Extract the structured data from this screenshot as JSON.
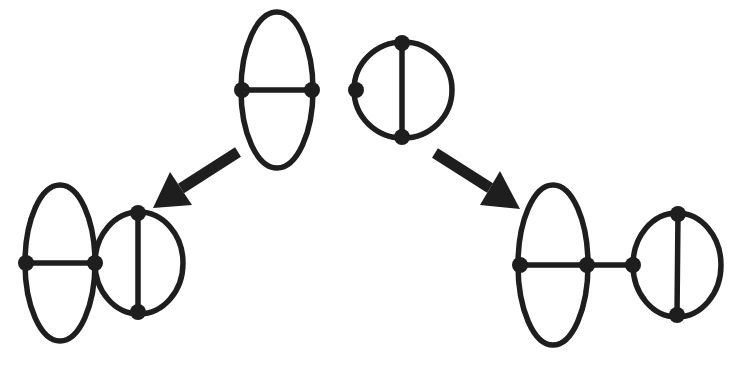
{
  "diagram": {
    "type": "feynman-graph-sewing",
    "colors": {
      "stroke": "#1e1e1e",
      "background": "#ffffff"
    },
    "graphs": [
      {
        "id": "top-theta",
        "label": "Ellipse with horizontal chord (theta graph)",
        "ellipse": {
          "cx": 277,
          "cy": 90,
          "rx": 36,
          "ry": 78
        },
        "chord": {
          "x1": 242,
          "y1": 90,
          "x2": 312,
          "y2": 90
        },
        "nodes": [
          {
            "x": 242,
            "y": 90
          },
          {
            "x": 312,
            "y": 90
          }
        ]
      },
      {
        "id": "top-tadpole-circle",
        "label": "Circle with vertical chord and extra vertex",
        "ellipse": {
          "cx": 403,
          "cy": 90,
          "rx": 49,
          "ry": 48
        },
        "chord": {
          "x1": 402,
          "y1": 43,
          "x2": 402,
          "y2": 137
        },
        "nodes": [
          {
            "x": 402,
            "y": 43
          },
          {
            "x": 402,
            "y": 137
          },
          {
            "x": 356,
            "y": 90
          }
        ]
      },
      {
        "id": "bottom-left-joined",
        "label": "Theta graph touching circle at shared vertex",
        "ellipses": [
          {
            "cx": 60,
            "cy": 263,
            "rx": 35,
            "ry": 78
          },
          {
            "cx": 139,
            "cy": 263,
            "rx": 44,
            "ry": 51
          }
        ],
        "chords": [
          {
            "x1": 26,
            "y1": 263,
            "x2": 95,
            "y2": 263
          },
          {
            "x1": 138,
            "y1": 212,
            "x2": 138,
            "y2": 313
          }
        ],
        "nodes": [
          {
            "x": 26,
            "y": 263
          },
          {
            "x": 95,
            "y": 263
          },
          {
            "x": 138,
            "y": 213
          },
          {
            "x": 138,
            "y": 312
          }
        ]
      },
      {
        "id": "bottom-right-bridged",
        "label": "Theta graph connected to circle by a bridge edge",
        "ellipses": [
          {
            "cx": 553,
            "cy": 265,
            "rx": 35,
            "ry": 80
          },
          {
            "cx": 677,
            "cy": 265,
            "rx": 44,
            "ry": 52
          }
        ],
        "chords": [
          {
            "x1": 520,
            "y1": 265,
            "x2": 633,
            "y2": 265
          },
          {
            "x1": 678,
            "y1": 213,
            "x2": 677,
            "y2": 316
          }
        ],
        "nodes": [
          {
            "x": 520,
            "y": 265
          },
          {
            "x": 587,
            "y": 265
          },
          {
            "x": 633,
            "y": 265
          },
          {
            "x": 678,
            "y": 214
          },
          {
            "x": 677,
            "y": 315
          }
        ]
      }
    ],
    "arrows": [
      {
        "id": "arrow-left",
        "from": {
          "x": 238,
          "y": 152
        },
        "to": {
          "x": 153,
          "y": 208
        },
        "head": [
          [
            153,
            208
          ],
          [
            170,
            172
          ],
          [
            192,
            205
          ]
        ]
      },
      {
        "id": "arrow-right",
        "from": {
          "x": 435,
          "y": 153
        },
        "to": {
          "x": 520,
          "y": 209
        },
        "head": [
          [
            520,
            209
          ],
          [
            500,
            171
          ],
          [
            480,
            205
          ]
        ]
      }
    ]
  }
}
